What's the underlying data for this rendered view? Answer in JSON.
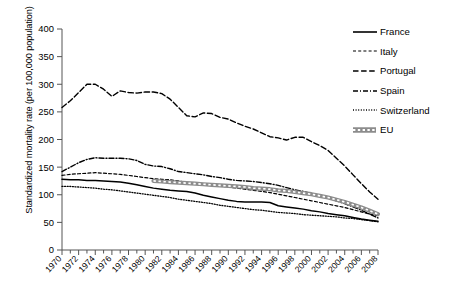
{
  "chart_data": {
    "type": "line",
    "title": "",
    "xlabel": "",
    "ylabel": "Standardized mortality rate (per 100,000 population)",
    "ylim": [
      0,
      400
    ],
    "yticks": [
      0,
      50,
      100,
      150,
      200,
      250,
      300,
      350,
      400
    ],
    "xlim": [
      1970,
      2008
    ],
    "xticks": [
      1970,
      1972,
      1974,
      1976,
      1978,
      1980,
      1982,
      1984,
      1986,
      1988,
      1990,
      1992,
      1994,
      1996,
      1998,
      2000,
      2002,
      2004,
      2006,
      2008
    ],
    "xtick_labels": [
      "1970",
      "1972",
      "1974",
      "1976",
      "1978",
      "1980",
      "1982",
      "1984",
      "1986",
      "1988",
      "1990",
      "1992",
      "1994",
      "1996",
      "1998",
      "2000",
      "2002",
      "2004",
      "2006",
      "2008"
    ],
    "minor_xticks_every": 1,
    "grid": false,
    "legend_position": "top-right",
    "x": [
      1970,
      1971,
      1972,
      1973,
      1974,
      1975,
      1976,
      1977,
      1978,
      1979,
      1980,
      1981,
      1982,
      1983,
      1984,
      1985,
      1986,
      1987,
      1988,
      1989,
      1990,
      1991,
      1992,
      1993,
      1994,
      1995,
      1996,
      1997,
      1998,
      1999,
      2000,
      2001,
      2002,
      2003,
      2004,
      2005,
      2006,
      2007,
      2008
    ],
    "series": [
      {
        "name": "France",
        "style": "solid",
        "color": "#000000",
        "values": [
          128,
          127,
          127,
          126,
          126,
          125,
          124,
          123,
          121,
          118,
          115,
          112,
          110,
          108,
          107,
          106,
          103,
          99,
          96,
          93,
          90,
          88,
          87,
          87,
          87,
          86,
          80,
          78,
          76,
          74,
          71,
          69,
          66,
          64,
          62,
          59,
          56,
          54,
          52
        ]
      },
      {
        "name": "Italy",
        "style": "dashed-short",
        "color": "#000000",
        "values": [
          135,
          137,
          138,
          139,
          140,
          139,
          138,
          137,
          135,
          133,
          131,
          129,
          128,
          127,
          125,
          122,
          119,
          118,
          117,
          116,
          114,
          112,
          110,
          108,
          106,
          104,
          101,
          98,
          95,
          92,
          89,
          86,
          83,
          80,
          77,
          73,
          69,
          65,
          62
        ]
      },
      {
        "name": "Portugal",
        "style": "dashed-long",
        "color": "#000000",
        "values": [
          258,
          270,
          285,
          300,
          300,
          291,
          278,
          288,
          285,
          284,
          286,
          286,
          283,
          273,
          258,
          243,
          241,
          248,
          247,
          240,
          237,
          230,
          224,
          219,
          212,
          205,
          203,
          199,
          204,
          204,
          196,
          189,
          180,
          166,
          152,
          136,
          120,
          105,
          92
        ]
      },
      {
        "name": "Spain",
        "style": "dash-dot",
        "color": "#000000",
        "values": [
          142,
          150,
          158,
          164,
          167,
          166,
          166,
          166,
          165,
          162,
          155,
          152,
          151,
          147,
          142,
          140,
          138,
          136,
          133,
          131,
          128,
          126,
          125,
          124,
          122,
          120,
          117,
          113,
          109,
          106,
          102,
          98,
          94,
          89,
          84,
          78,
          72,
          65,
          58
        ]
      },
      {
        "name": "Switzerland",
        "style": "dotted",
        "color": "#000000",
        "values": [
          115,
          115,
          114,
          113,
          112,
          110,
          109,
          107,
          105,
          103,
          101,
          99,
          97,
          95,
          92,
          90,
          88,
          86,
          84,
          81,
          79,
          77,
          75,
          73,
          72,
          70,
          68,
          67,
          66,
          64,
          63,
          62,
          61,
          60,
          58,
          57,
          55,
          53,
          51
        ]
      },
      {
        "name": "EU",
        "style": "thick-gray-dashed",
        "color": "#8c8c8c",
        "values": [
          null,
          null,
          null,
          null,
          null,
          null,
          null,
          null,
          null,
          null,
          null,
          125,
          124,
          123,
          122,
          121,
          120,
          119,
          118,
          117,
          116,
          115,
          114,
          112,
          111,
          110,
          108,
          107,
          105,
          103,
          101,
          98,
          95,
          91,
          87,
          82,
          77,
          71,
          65
        ]
      }
    ]
  },
  "legend": {
    "items": [
      {
        "label": "France"
      },
      {
        "label": "Italy"
      },
      {
        "label": "Portugal"
      },
      {
        "label": "Spain"
      },
      {
        "label": "Switzerland"
      },
      {
        "label": "EU"
      }
    ]
  }
}
